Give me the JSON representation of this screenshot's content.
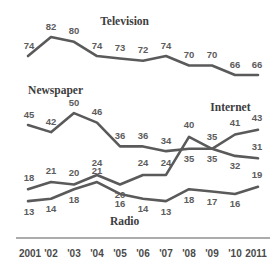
{
  "chart_data": {
    "type": "line",
    "title": "",
    "subtitle": "",
    "xlabel": "",
    "ylabel": "",
    "grid": false,
    "legend_position": "inline-series-labels",
    "x": [
      2001,
      2002,
      2003,
      2004,
      2005,
      2006,
      2007,
      2008,
      2009,
      2010,
      2011
    ],
    "categories": [
      "2001",
      "'02",
      "'03",
      "'04",
      "'05",
      "'06",
      "'07",
      "'08",
      "'09",
      "'10",
      "2011"
    ],
    "ylim": [
      0,
      90
    ],
    "xlim": [
      2001,
      2011
    ],
    "series": [
      {
        "name": "Television",
        "values": [
          74,
          82,
          80,
          74,
          73,
          72,
          74,
          70,
          70,
          66,
          66
        ],
        "color": "#5a5a5a",
        "label_x": 2005.2,
        "label_value": 88
      },
      {
        "name": "Newspaper",
        "values": [
          45,
          42,
          50,
          46,
          36,
          36,
          34,
          35,
          35,
          32,
          31
        ],
        "color": "#5a5a5a",
        "label_x": 2002.2,
        "label_value": 59
      },
      {
        "name": "Internet",
        "values": [
          18,
          21,
          20,
          24,
          20,
          24,
          24,
          40,
          35,
          41,
          43
        ],
        "color": "#5a5a5a",
        "label_x": 2009.8,
        "label_value": 52
      },
      {
        "name": "Radio",
        "values": [
          13,
          14,
          18,
          21,
          16,
          14,
          13,
          18,
          17,
          16,
          19
        ],
        "color": "#5a5a5a",
        "label_x": 2005.2,
        "label_value": 4
      }
    ],
    "point_label_offsets": {
      "Television": [
        -10,
        -10,
        -10,
        -10,
        -10,
        -10,
        -10,
        -10,
        -10,
        -10,
        -10
      ],
      "Newspaper": [
        -10,
        -10,
        -10,
        -10,
        -10,
        -10,
        -10,
        11,
        -11,
        11,
        -11
      ],
      "Internet": [
        -11,
        -11,
        -11,
        -11,
        11,
        -11,
        -11,
        -11,
        11,
        -11,
        -11
      ],
      "Radio": [
        11,
        11,
        11,
        -11,
        11,
        11,
        11,
        11,
        11,
        11,
        -11
      ]
    },
    "axis": {
      "color": "#8f8f8f",
      "show_x_axis_line": true,
      "show_y_axis_line": false
    }
  }
}
